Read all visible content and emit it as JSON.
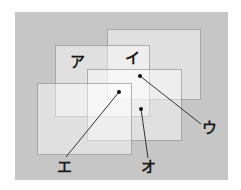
{
  "diagram": {
    "background": {
      "x": 15,
      "y": 12,
      "width": 213,
      "height": 168,
      "color": "#c6c6c6"
    },
    "rectangles": [
      {
        "id": "B",
        "x": 107,
        "y": 29,
        "width": 94,
        "height": 71
      },
      {
        "id": "A",
        "x": 55,
        "y": 45,
        "width": 95,
        "height": 72
      },
      {
        "id": "C",
        "x": 87,
        "y": 69,
        "width": 95,
        "height": 72
      },
      {
        "id": "D",
        "x": 37,
        "y": 83,
        "width": 95,
        "height": 72
      }
    ],
    "labels": [
      {
        "text": "ア",
        "x": 77,
        "y": 62
      },
      {
        "text": "イ",
        "x": 132,
        "y": 58
      },
      {
        "text": "ウ",
        "x": 209,
        "y": 128
      },
      {
        "text": "エ",
        "x": 64,
        "y": 167
      },
      {
        "text": "オ",
        "x": 148,
        "y": 167
      }
    ],
    "pointers": [
      {
        "label": "ウ",
        "dot": {
          "x": 140,
          "y": 76
        },
        "end": {
          "x": 201,
          "y": 124
        }
      },
      {
        "label": "エ",
        "dot": {
          "x": 119,
          "y": 92
        },
        "end": {
          "x": 66,
          "y": 157
        }
      },
      {
        "label": "オ",
        "dot": {
          "x": 141,
          "y": 109
        },
        "end": {
          "x": 148,
          "y": 158
        }
      }
    ],
    "line_color": "#333333",
    "dot_color": "#111111"
  }
}
